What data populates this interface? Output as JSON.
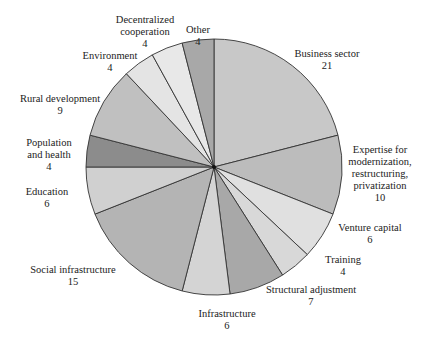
{
  "chart_data": {
    "type": "pie",
    "title": "",
    "start_angle_deg": 0,
    "direction": "clockwise",
    "total": 100,
    "center": [
      214,
      167
    ],
    "radius": 128,
    "slices": [
      {
        "label": "Business sector",
        "lines": [
          "Business sector"
        ],
        "value": 21,
        "color": "#c8c8c8",
        "label_pos": [
          327,
          48
        ]
      },
      {
        "label": "Expertise for modernization, restructuring, privatization",
        "lines": [
          "Expertise for",
          "modernization,",
          "restructuring,",
          "privatization"
        ],
        "value": 10,
        "color": "#bcbcbc",
        "label_pos": [
          380,
          144
        ]
      },
      {
        "label": "Venture capital",
        "lines": [
          "Venture capital"
        ],
        "value": 6,
        "color": "#e0e0e0",
        "label_pos": [
          370,
          222
        ]
      },
      {
        "label": "Training",
        "lines": [
          "Training"
        ],
        "value": 4,
        "color": "#d8d8d8",
        "label_pos": [
          343,
          254
        ]
      },
      {
        "label": "Structural adjustment",
        "lines": [
          "Structural adjustment"
        ],
        "value": 7,
        "color": "#a8a8a8",
        "label_pos": [
          311,
          284
        ]
      },
      {
        "label": "Infrastructure",
        "lines": [
          "Infrastructure"
        ],
        "value": 6,
        "color": "#d4d4d4",
        "label_pos": [
          227,
          308
        ]
      },
      {
        "label": "Social infrastructure",
        "lines": [
          "Social infrastructure"
        ],
        "value": 15,
        "color": "#b4b4b4",
        "label_pos": [
          73,
          264
        ]
      },
      {
        "label": "Education",
        "lines": [
          "Education"
        ],
        "value": 6,
        "color": "#d0d0d0",
        "label_pos": [
          47,
          186
        ]
      },
      {
        "label": "Population and health",
        "lines": [
          "Population",
          "and health"
        ],
        "value": 4,
        "color": "#8c8c8c",
        "label_pos": [
          49,
          137
        ]
      },
      {
        "label": "Rural development",
        "lines": [
          "Rural development"
        ],
        "value": 9,
        "color": "#c0c0c0",
        "label_pos": [
          60,
          93
        ]
      },
      {
        "label": "Environment",
        "lines": [
          "Environment"
        ],
        "value": 4,
        "color": "#e4e4e4",
        "label_pos": [
          110,
          50
        ]
      },
      {
        "label": "Decentralized cooperation",
        "lines": [
          "Decentralized",
          "cooperation"
        ],
        "value": 4,
        "color": "#e8e8e8",
        "label_pos": [
          145,
          14
        ]
      },
      {
        "label": "Other",
        "lines": [
          "Other"
        ],
        "value": 4,
        "color": "#a8a8a8",
        "label_pos": [
          198,
          24
        ]
      }
    ],
    "legend": "none",
    "data_labels": "outside, name and value"
  }
}
